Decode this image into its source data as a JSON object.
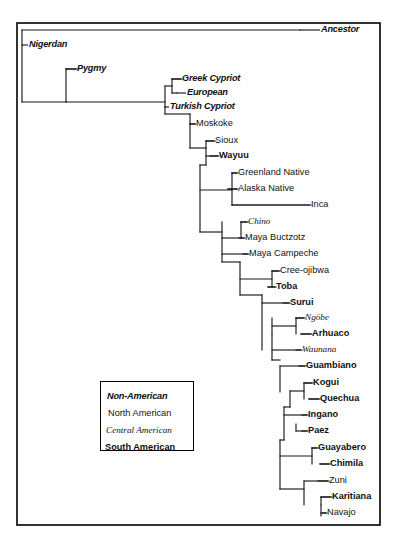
{
  "figure": {
    "frame": {
      "x": 17,
      "y": 23,
      "width": 363,
      "height": 502,
      "stroke": "#000000"
    },
    "background": "#ffffff",
    "line_color": "#1a1a1a"
  },
  "legend": {
    "box": {
      "x": 100,
      "y": 381,
      "width": 94,
      "height": 70
    },
    "entries": [
      {
        "label": "Non-American",
        "style": "sty-nonamerican",
        "x": 107,
        "y": 392
      },
      {
        "label": "North American",
        "style": "sty-north",
        "x": 108,
        "y": 409
      },
      {
        "label": "Central American",
        "style": "sty-central",
        "x": 106,
        "y": 426
      },
      {
        "label": "South American",
        "style": "sty-south",
        "x": 105,
        "y": 443
      }
    ]
  },
  "chart_data": {
    "type": "tree",
    "root_label": "Ancestor",
    "groups": [
      "Non-American",
      "North American",
      "Central American",
      "South American"
    ],
    "tips": [
      {
        "name": "Ancestor",
        "group": "Non-American",
        "style": "sty-nonamerican",
        "x": 321,
        "y": 30,
        "tick_x": 300
      },
      {
        "name": "Nigerdan",
        "group": "Non-American",
        "style": "sty-nonamerican",
        "x": 29,
        "y": 45,
        "tick_x": 22
      },
      {
        "name": "Pygmy",
        "group": "Non-American",
        "style": "sty-nonamerican",
        "x": 77,
        "y": 69,
        "tick_x": 66
      },
      {
        "name": "Greek Cypriot",
        "group": "Non-American",
        "style": "sty-nonamerican",
        "x": 182,
        "y": 79,
        "tick_x": 172
      },
      {
        "name": "European",
        "group": "Non-American",
        "style": "sty-nonamerican",
        "x": 187,
        "y": 93,
        "tick_x": 177
      },
      {
        "name": "Turkish Cypriot",
        "group": "Non-American",
        "style": "sty-nonamerican",
        "x": 170,
        "y": 107,
        "tick_x": 165
      },
      {
        "name": "Moskoke",
        "group": "North American",
        "style": "sty-north",
        "x": 196,
        "y": 124,
        "tick_x": 190
      },
      {
        "name": "Sioux",
        "group": "North American",
        "style": "sty-north",
        "x": 215,
        "y": 141,
        "tick_x": 206
      },
      {
        "name": "Wayuu",
        "group": "South American",
        "style": "sty-south",
        "x": 219,
        "y": 156,
        "tick_x": 210
      },
      {
        "name": "Greenland Native",
        "group": "North American",
        "style": "sty-north",
        "x": 238,
        "y": 173,
        "tick_x": 232
      },
      {
        "name": "Alaska Native",
        "group": "North American",
        "style": "sty-north",
        "x": 238,
        "y": 189,
        "tick_x": 228
      },
      {
        "name": "Inca",
        "group": "South American",
        "style": "sty-north",
        "x": 311,
        "y": 205,
        "tick_x": 232
      },
      {
        "name": "Chino",
        "group": "Central American",
        "style": "sty-central",
        "x": 248,
        "y": 222,
        "tick_x": 241
      },
      {
        "name": "Maya Buctzotz",
        "group": "North American",
        "style": "sty-north",
        "x": 245,
        "y": 238,
        "tick_x": 239
      },
      {
        "name": "Maya Campeche",
        "group": "North American",
        "style": "sty-north",
        "x": 249,
        "y": 254,
        "tick_x": 243
      },
      {
        "name": "Cree-ojibwa",
        "group": "North American",
        "style": "sty-north",
        "x": 280,
        "y": 271,
        "tick_x": 272
      },
      {
        "name": "Toba",
        "group": "South American",
        "style": "sty-south",
        "x": 276,
        "y": 287,
        "tick_x": 268
      },
      {
        "name": "Surui",
        "group": "South American",
        "style": "sty-south",
        "x": 290,
        "y": 303,
        "tick_x": 283
      },
      {
        "name": "Ngöbe",
        "group": "Central American",
        "style": "sty-central",
        "x": 305,
        "y": 318,
        "tick_x": 296
      },
      {
        "name": "Arhuaco",
        "group": "South American",
        "style": "sty-south",
        "x": 312,
        "y": 334,
        "tick_x": 301
      },
      {
        "name": "Waunana",
        "group": "Central American",
        "style": "sty-central",
        "x": 302,
        "y": 350,
        "tick_x": 296
      },
      {
        "name": "Guambiano",
        "group": "South American",
        "style": "sty-south",
        "x": 306,
        "y": 366,
        "tick_x": 299
      },
      {
        "name": "Kogui",
        "group": "South American",
        "style": "sty-south",
        "x": 313,
        "y": 383,
        "tick_x": 304
      },
      {
        "name": "Quechua",
        "group": "South American",
        "style": "sty-south",
        "x": 320,
        "y": 399,
        "tick_x": 309
      },
      {
        "name": "Ingano",
        "group": "South American",
        "style": "sty-south",
        "x": 308,
        "y": 415,
        "tick_x": 302
      },
      {
        "name": "Paez",
        "group": "South American",
        "style": "sty-south",
        "x": 308,
        "y": 431,
        "tick_x": 302
      },
      {
        "name": "Guayabero",
        "group": "South American",
        "style": "sty-south",
        "x": 318,
        "y": 448,
        "tick_x": 312
      },
      {
        "name": "Chimila",
        "group": "South American",
        "style": "sty-south",
        "x": 330,
        "y": 464,
        "tick_x": 320
      },
      {
        "name": "Zuni",
        "group": "North American",
        "style": "sty-north",
        "x": 329,
        "y": 481,
        "tick_x": 318
      },
      {
        "name": "Karitiana",
        "group": "South American",
        "style": "sty-south",
        "x": 332,
        "y": 497,
        "tick_x": 321
      },
      {
        "name": "Navajo",
        "group": "North American",
        "style": "sty-north",
        "x": 327,
        "y": 513,
        "tick_x": 322
      }
    ],
    "branches": [
      {
        "id": "root-stem",
        "d": "M 22 30 L 300 30"
      },
      {
        "id": "root-vert",
        "d": "M 22 30 L 22 102"
      },
      {
        "id": "nigerdan-leaf",
        "d": "M 22 102 L 66 102"
      },
      {
        "id": "node2-vert",
        "d": "M 66 69 L 66 102"
      },
      {
        "id": "pygmy-leaf",
        "d": "M 66 69 L 77 69"
      },
      {
        "id": "node2-base",
        "d": "M 66 102 L 165 102"
      },
      {
        "id": "node3-vert",
        "d": "M 165 86 L 165 114"
      },
      {
        "id": "cyp-vert",
        "d": "M 172 79 L 172 93"
      },
      {
        "id": "greek-leaf",
        "d": "M 172 79 L 182 79"
      },
      {
        "id": "euro-leaf",
        "d": "M 172 93 L 177 93"
      },
      {
        "id": "cyp-stem",
        "d": "M 165 86 L 172 86"
      },
      {
        "id": "turk-leaf",
        "d": "M 165 107 L 165 107"
      },
      {
        "id": "node4-vert",
        "d": "M 190 114 L 190 148"
      },
      {
        "id": "node4-stem",
        "d": "M 165 114 L 190 114"
      },
      {
        "id": "moskoke-leaf",
        "d": "M 190 124 L 196 124"
      },
      {
        "id": "node5-vert",
        "d": "M 206 141 L 206 165"
      },
      {
        "id": "node5-stem",
        "d": "M 190 148 L 206 148"
      },
      {
        "id": "sioux-leaf",
        "d": "M 206 141 L 215 141"
      },
      {
        "id": "wayuu-leaf",
        "d": "M 206 156 L 219 156"
      },
      {
        "id": "node6-vert",
        "d": "M 200 165 L 200 232"
      },
      {
        "id": "node6-stem",
        "d": "M 200 165 L 206 165"
      },
      {
        "id": "node7-vert",
        "d": "M 232 173 L 232 205"
      },
      {
        "id": "node7-stem",
        "d": "M 200 190 L 232 190"
      },
      {
        "id": "green-leaf",
        "d": "M 232 173 L 238 173"
      },
      {
        "id": "alaska-leaf",
        "d": "M 228 189 L 238 189"
      },
      {
        "id": "inca-leaf",
        "d": "M 232 205 L 311 205"
      },
      {
        "id": "node8-vert",
        "d": "M 222 222 L 222 262"
      },
      {
        "id": "node8-stem",
        "d": "M 200 232 L 222 232"
      },
      {
        "id": "chino-leaf",
        "d": "M 241 222 L 248 222"
      },
      {
        "id": "chino-vert",
        "d": "M 241 222 L 241 238"
      },
      {
        "id": "maya1-leaf",
        "d": "M 222 238 L 245 238"
      },
      {
        "id": "maya2-leaf",
        "d": "M 222 254 L 249 254"
      },
      {
        "id": "node9-vert",
        "d": "M 240 262 L 240 295"
      },
      {
        "id": "node9-stem",
        "d": "M 222 262 L 240 262"
      },
      {
        "id": "node10-vert",
        "d": "M 272 271 L 272 287"
      },
      {
        "id": "node10-stem",
        "d": "M 240 279 L 272 279"
      },
      {
        "id": "cree-leaf",
        "d": "M 272 271 L 280 271"
      },
      {
        "id": "toba-leaf",
        "d": "M 268 287 L 276 287"
      },
      {
        "id": "node11-vert",
        "d": "M 262 295 L 262 350"
      },
      {
        "id": "node11-stem",
        "d": "M 240 295 L 262 295"
      },
      {
        "id": "surui-leaf",
        "d": "M 262 303 L 290 303"
      },
      {
        "id": "node12-vert",
        "d": "M 296 318 L 296 334"
      },
      {
        "id": "node12-stem",
        "d": "M 272 326 L 296 326"
      },
      {
        "id": "node12-down",
        "d": "M 272 318 L 272 334"
      },
      {
        "id": "ngobe-leaf",
        "d": "M 296 318 L 305 318"
      },
      {
        "id": "arhuaco-leaf",
        "d": "M 301 334 L 312 334"
      },
      {
        "id": "node13-vert",
        "d": "M 272 334 L 272 360"
      },
      {
        "id": "waunana-leaf",
        "d": "M 272 350 L 302 350"
      },
      {
        "id": "node14-vert",
        "d": "M 280 366 L 280 392"
      },
      {
        "id": "node14-stem",
        "d": "M 272 360 L 280 360"
      },
      {
        "id": "guamb-leaf",
        "d": "M 280 366 L 306 366"
      },
      {
        "id": "node15-vert",
        "d": "M 304 383 L 304 399"
      },
      {
        "id": "node15-stem",
        "d": "M 290 391 L 304 391"
      },
      {
        "id": "kogui-leaf",
        "d": "M 304 383 L 313 383"
      },
      {
        "id": "quechua-leaf",
        "d": "M 309 399 L 320 399"
      },
      {
        "id": "node16-vert",
        "d": "M 290 391 L 290 407"
      },
      {
        "id": "node17-vert",
        "d": "M 284 407 L 284 440"
      },
      {
        "id": "node17-stem",
        "d": "M 284 407 L 290 407"
      },
      {
        "id": "ingano-leaf",
        "d": "M 284 415 L 308 415"
      },
      {
        "id": "paez-leaf",
        "d": "M 296 431 L 308 431"
      },
      {
        "id": "paez-vert",
        "d": "M 296 424 L 296 431"
      },
      {
        "id": "node18-vert",
        "d": "M 280 440 L 280 489"
      },
      {
        "id": "node18-stem",
        "d": "M 284 440 L 280 440"
      },
      {
        "id": "node19-vert",
        "d": "M 312 448 L 312 464"
      },
      {
        "id": "node19-stem",
        "d": "M 280 456 L 312 456"
      },
      {
        "id": "guaya-leaf",
        "d": "M 312 448 L 318 448"
      },
      {
        "id": "chimila-leaf",
        "d": "M 320 464 L 330 464"
      },
      {
        "id": "node20-vert",
        "d": "M 304 481 L 304 505"
      },
      {
        "id": "node20-stem",
        "d": "M 280 489 L 304 489"
      },
      {
        "id": "zuni-leaf",
        "d": "M 304 481 L 329 481"
      },
      {
        "id": "karit-leaf",
        "d": "M 321 497 L 332 497"
      },
      {
        "id": "karit-vert",
        "d": "M 321 497 L 321 505"
      },
      {
        "id": "navajo-vert",
        "d": "M 321 505 L 321 516"
      },
      {
        "id": "navajo-leaf",
        "d": "M 321 513 L 327 513"
      }
    ]
  }
}
